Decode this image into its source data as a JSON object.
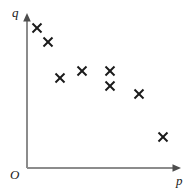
{
  "chart_data": {
    "type": "scatter",
    "title": "",
    "subtitle": "",
    "xlabel": "p",
    "ylabel": "q",
    "origin_label": "O",
    "grid": false,
    "legend": null,
    "axis_style": "arrow",
    "xlim": [
      0,
      10
    ],
    "ylim": [
      0,
      10
    ],
    "xticks": [],
    "yticks": [],
    "series": [
      {
        "name": "observations",
        "marker": "x",
        "color": "#1a1a1a",
        "x": [
          0.7,
          1.5,
          2.3,
          3.9,
          5.9,
          5.9,
          7.9,
          9.1,
          10.8
        ],
        "y": [
          9.2,
          8.3,
          6.0,
          6.5,
          6.5,
          5.4,
          4.8,
          4.8,
          2.0
        ],
        "points": [
          {
            "x": 0.7,
            "y": 9.2,
            "px": 37,
            "py": 28
          },
          {
            "x": 1.5,
            "y": 8.3,
            "px": 48,
            "py": 42
          },
          {
            "x": 2.3,
            "y": 6.0,
            "px": 60,
            "py": 78
          },
          {
            "x": 3.9,
            "y": 6.5,
            "px": 82,
            "py": 71
          },
          {
            "x": 5.9,
            "y": 6.5,
            "px": 110,
            "py": 71
          },
          {
            "x": 5.9,
            "y": 5.4,
            "px": 110,
            "py": 86
          },
          {
            "x": 7.9,
            "y": 4.8,
            "px": 139,
            "py": 94
          },
          {
            "x": 9.1,
            "y": 2.0,
            "px": 163,
            "py": 137
          },
          {
            "x": 10.8,
            "y": 2.0,
            "px": 163,
            "py": 137
          }
        ]
      }
    ],
    "annotations": []
  },
  "axes": {
    "x_label": "p",
    "y_label": "q",
    "origin": "O",
    "color": "#8c8c8c",
    "origin_x": 27,
    "origin_y": 168,
    "x_end": 180,
    "y_end": 14
  },
  "markers": {
    "color": "#1a1a1a",
    "size": 9,
    "stroke_width": 2.0,
    "list": [
      {
        "name": "data-point-1",
        "cx": 37,
        "cy": 28
      },
      {
        "name": "data-point-2",
        "cx": 48,
        "cy": 42
      },
      {
        "name": "data-point-3",
        "cx": 60,
        "cy": 78
      },
      {
        "name": "data-point-4",
        "cx": 82,
        "cy": 71
      },
      {
        "name": "data-point-5",
        "cx": 110,
        "cy": 71
      },
      {
        "name": "data-point-6",
        "cx": 110,
        "cy": 86
      },
      {
        "name": "data-point-7",
        "cx": 139,
        "cy": 94
      },
      {
        "name": "data-point-8",
        "cx": 163,
        "cy": 137
      }
    ]
  }
}
